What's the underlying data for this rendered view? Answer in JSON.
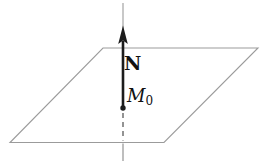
{
  "labels": {
    "normal_vector": "N",
    "point_base": "M",
    "point_subscript": "0"
  },
  "icons": {
    "arrowhead": "up-arrow-icon"
  },
  "colors": {
    "background": "#ffffff",
    "plane_edge": "#9b9b9b",
    "axis_line": "#9b9b9b",
    "vector": "#1c1c1c",
    "dashed_hidden": "#5a5a5a",
    "label_text": "#111111"
  }
}
